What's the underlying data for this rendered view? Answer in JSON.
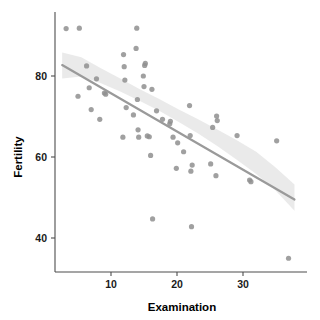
{
  "chart_data": {
    "type": "scatter",
    "title": "",
    "subtitle": "",
    "xlabel": "Examination",
    "ylabel": "Fertility",
    "xlim": [
      1.5,
      38.5
    ],
    "ylim": [
      32.0,
      94.0
    ],
    "xticks": [
      10,
      20,
      30
    ],
    "xtick_labels": [
      "10",
      "20",
      "30"
    ],
    "yticks": [
      40,
      60,
      80
    ],
    "ytick_labels": [
      "40",
      "60",
      "80"
    ],
    "grid": false,
    "legend": false,
    "legend_position": "none",
    "point_color": "#8f8f8f",
    "line_color": "#9a9a9a",
    "ribbon_color": "#d9d9d9",
    "axis_color": "#4d4d4d",
    "x": [
      3.2,
      5.0,
      5.2,
      6.3,
      6.7,
      7.0,
      7.8,
      8.3,
      9.0,
      9.2,
      11.8,
      11.9,
      12.0,
      12.1,
      12.3,
      13.4,
      13.8,
      13.9,
      14.0,
      14.1,
      14.2,
      14.9,
      15.0,
      15.1,
      15.2,
      15.5,
      15.8,
      16.0,
      16.2,
      16.3,
      16.9,
      17.8,
      18.9,
      19.0,
      19.4,
      19.9,
      20.1,
      21.0,
      21.9,
      22.0,
      22.1,
      22.2,
      22.3,
      25.1,
      25.4,
      25.9,
      26.0,
      26.1,
      29.1,
      31.0,
      31.2,
      35.1,
      36.9
    ],
    "y": [
      91.7,
      75.0,
      91.8,
      82.5,
      77.1,
      71.7,
      79.3,
      69.3,
      75.8,
      75.5,
      64.9,
      85.3,
      82.3,
      79.0,
      72.2,
      70.4,
      86.8,
      91.8,
      74.2,
      66.7,
      64.9,
      80.0,
      77.4,
      82.6,
      83.1,
      65.2,
      65.0,
      60.4,
      76.7,
      44.7,
      71.4,
      69.3,
      68.2,
      68.8,
      64.9,
      57.2,
      63.5,
      61.3,
      72.7,
      65.3,
      56.5,
      42.8,
      58.0,
      58.3,
      67.3,
      55.4,
      70.1,
      69.0,
      65.3,
      54.3,
      53.9,
      64.0,
      35.0
    ],
    "regression": {
      "type": "linear",
      "x_start": 2.6,
      "y_start": 82.7,
      "x_end": 37.8,
      "y_end": 49.5,
      "slope": -0.943,
      "intercept": 85.2
    },
    "confidence_band": {
      "level": 0.95,
      "upper": [
        85.8,
        84.6,
        82.0,
        79.4,
        76.8,
        74.3,
        71.8,
        69.3,
        66.8,
        64.2,
        61.3,
        57.5,
        53.2
      ],
      "lower": [
        79.4,
        79.9,
        78.3,
        76.2,
        73.9,
        71.4,
        68.7,
        65.8,
        62.7,
        59.4,
        55.8,
        51.8,
        46.7
      ],
      "x_grid": [
        2.6,
        5.5,
        8.4,
        11.4,
        14.3,
        17.3,
        20.2,
        23.2,
        26.1,
        29.0,
        32.0,
        34.9,
        37.8
      ]
    }
  },
  "axes": {
    "x_title": "Examination",
    "y_title": "Fertility"
  }
}
